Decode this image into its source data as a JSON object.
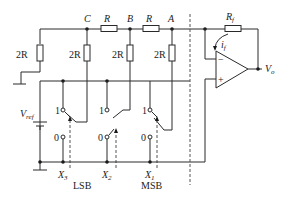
{
  "nodes": {
    "c": "C",
    "b": "B",
    "a": "A"
  },
  "resistors": {
    "series_cb": "R",
    "series_ba": "R",
    "shunt_left": "2R",
    "shunt_c": "2R",
    "shunt_b": "2R",
    "shunt_a": "2R",
    "feedback": "R",
    "feedback_sub": "f"
  },
  "current": {
    "main": "i",
    "sub": "f"
  },
  "opamp": {
    "minus": "−",
    "plus": "+"
  },
  "output": {
    "main": "V",
    "sub": "o"
  },
  "reference": {
    "main": "V",
    "sub": "ref"
  },
  "switches": [
    {
      "bit": "X",
      "index": "3",
      "one": "1",
      "zero": "0"
    },
    {
      "bit": "X",
      "index": "2",
      "one": "1",
      "zero": "0"
    },
    {
      "bit": "X",
      "index": "1",
      "one": "1",
      "zero": "0"
    }
  ],
  "labels": {
    "lsb": "LSB",
    "msb": "MSB"
  }
}
